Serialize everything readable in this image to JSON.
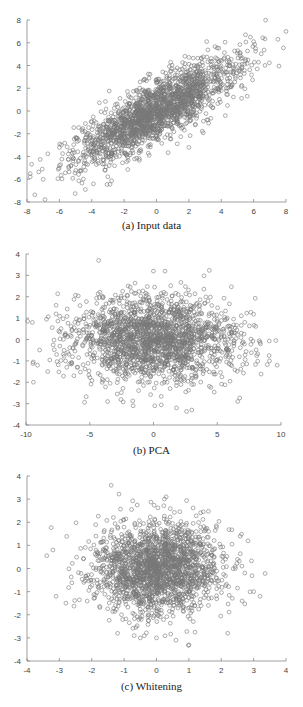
{
  "chart_data": [
    {
      "type": "scatter",
      "title": "",
      "caption": "(a) Input data",
      "xlabel": "",
      "ylabel": "",
      "xlim": [
        -8,
        8
      ],
      "ylim": [
        -8,
        8
      ],
      "xticks": [
        -8,
        -6,
        -4,
        -2,
        0,
        2,
        4,
        6,
        8
      ],
      "yticks": [
        -8,
        -6,
        -4,
        -2,
        0,
        2,
        4,
        6,
        8
      ],
      "grid": false,
      "legend": null,
      "marker": "open-circle",
      "marker_color": "#777777",
      "n_points": 2000,
      "distribution": {
        "kind": "correlated-gaussian",
        "mean": [
          0,
          0
        ],
        "major_axis_std": 3.3,
        "minor_axis_std": 1.0,
        "angle_deg": 42
      },
      "sample_points": [
        [
          8.0,
          7.0
        ],
        [
          7.5,
          6.3
        ],
        [
          5.5,
          6.7
        ],
        [
          5.8,
          6.5
        ],
        [
          6.0,
          6.1
        ],
        [
          -7.8,
          -5.5
        ],
        [
          -7.0,
          -6.0
        ],
        [
          -4.4,
          -6.9
        ],
        [
          -3.9,
          -6.4
        ],
        [
          -6.0,
          -4.8
        ],
        [
          -6.0,
          -3.2
        ],
        [
          2.0,
          -3.2
        ],
        [
          5.6,
          1.3
        ],
        [
          3.1,
          6.1
        ]
      ]
    },
    {
      "type": "scatter",
      "title": "",
      "caption": "(b) PCA",
      "xlabel": "",
      "ylabel": "",
      "xlim": [
        -10,
        10
      ],
      "ylim": [
        -4,
        4
      ],
      "xticks": [
        -10,
        -5,
        0,
        5,
        10
      ],
      "yticks": [
        -4,
        -3,
        -2,
        -1,
        0,
        1,
        2,
        3,
        4
      ],
      "grid": false,
      "legend": null,
      "marker": "open-circle",
      "marker_color": "#777777",
      "n_points": 2000,
      "distribution": {
        "kind": "gaussian",
        "mean": [
          0,
          0
        ],
        "std": [
          3.3,
          1.0
        ]
      },
      "sample_points": [
        [
          -4.3,
          3.7
        ],
        [
          0.9,
          3.2
        ],
        [
          -9.5,
          0.8
        ],
        [
          9.7,
          -1.2
        ],
        [
          9.1,
          -1.0
        ],
        [
          3.0,
          -3.3
        ],
        [
          1.8,
          -3.2
        ],
        [
          -1.6,
          -3.1
        ],
        [
          0.1,
          -3.1
        ],
        [
          -3.6,
          -2.9
        ],
        [
          6.6,
          -2.9
        ],
        [
          -9.1,
          -1.2
        ],
        [
          -8.3,
          -1.5
        ]
      ]
    },
    {
      "type": "scatter",
      "title": "",
      "caption": "(c) Whitening",
      "xlabel": "",
      "ylabel": "",
      "xlim": [
        -4,
        4
      ],
      "ylim": [
        -4,
        4
      ],
      "xticks": [
        -4,
        -3,
        -2,
        -1,
        0,
        1,
        2,
        3,
        4
      ],
      "yticks": [
        -4,
        -3,
        -2,
        -1,
        0,
        1,
        2,
        3,
        4
      ],
      "grid": false,
      "legend": null,
      "marker": "open-circle",
      "marker_color": "#777777",
      "n_points": 2000,
      "distribution": {
        "kind": "gaussian",
        "mean": [
          0,
          0
        ],
        "std": [
          1.0,
          1.0
        ]
      },
      "sample_points": [
        [
          -1.4,
          3.6
        ],
        [
          0.3,
          3.1
        ],
        [
          -3.2,
          0.8
        ],
        [
          3.2,
          -1.2
        ],
        [
          3.0,
          -1.0
        ],
        [
          1.0,
          -3.3
        ],
        [
          0.6,
          -3.1
        ],
        [
          -0.5,
          -3.0
        ],
        [
          0.0,
          -3.0
        ],
        [
          -1.2,
          -2.8
        ],
        [
          2.2,
          -2.8
        ],
        [
          -3.1,
          -1.2
        ],
        [
          -2.8,
          -1.5
        ]
      ]
    }
  ],
  "captions": {
    "a": "(a) Input data",
    "b": "(b) PCA",
    "c": "(c) Whitening"
  }
}
